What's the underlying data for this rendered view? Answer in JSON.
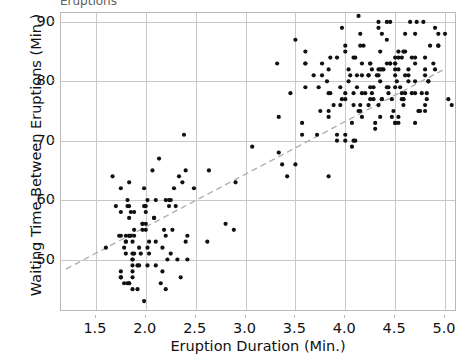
{
  "chart_data": {
    "type": "scatter",
    "title": "Eruptions",
    "xlabel": "Eruption Duration (Min.)",
    "ylabel": "Waiting Time Between Eruptions (Min.)",
    "xlim": [
      1.15,
      5.1
    ],
    "ylim": [
      41.5,
      91.5
    ],
    "xticks": [
      "1.5",
      "2.0",
      "2.5",
      "3.0",
      "3.5",
      "4.0",
      "4.5",
      "5.0"
    ],
    "xtick_values": [
      1.5,
      2.0,
      2.5,
      3.0,
      3.5,
      4.0,
      4.5,
      5.0
    ],
    "yticks": [
      "50",
      "60",
      "70",
      "80",
      "90"
    ],
    "ytick_values": [
      50,
      60,
      70,
      80,
      90
    ],
    "grid": true,
    "legend": "none",
    "marker": {
      "shape": "circle",
      "color": "#111111",
      "size": 4.2
    },
    "trendline": {
      "style": "dashed",
      "color": "#b0b0b0",
      "width": 1.4,
      "x": [
        1.2,
        5.0
      ],
      "y": [
        48.4,
        82.1
      ]
    },
    "series": [
      {
        "name": "Old Faithful eruptions",
        "points": [
          [
            3.6,
            79
          ],
          [
            1.8,
            54
          ],
          [
            3.333,
            74
          ],
          [
            2.283,
            62
          ],
          [
            4.533,
            85
          ],
          [
            2.883,
            55
          ],
          [
            4.7,
            88
          ],
          [
            3.6,
            85
          ],
          [
            1.95,
            51
          ],
          [
            4.35,
            85
          ],
          [
            1.833,
            54
          ],
          [
            3.917,
            84
          ],
          [
            4.2,
            78
          ],
          [
            1.75,
            47
          ],
          [
            4.7,
            83
          ],
          [
            2.167,
            52
          ],
          [
            1.75,
            62
          ],
          [
            4.8,
            84
          ],
          [
            1.6,
            52
          ],
          [
            4.25,
            79
          ],
          [
            1.8,
            51
          ],
          [
            1.75,
            47
          ],
          [
            3.45,
            78
          ],
          [
            3.067,
            69
          ],
          [
            4.533,
            74
          ],
          [
            3.6,
            83
          ],
          [
            1.967,
            55
          ],
          [
            4.083,
            76
          ],
          [
            3.85,
            78
          ],
          [
            4.433,
            79
          ],
          [
            4.3,
            73
          ],
          [
            4.467,
            77
          ],
          [
            3.367,
            66
          ],
          [
            4.033,
            80
          ],
          [
            3.833,
            74
          ],
          [
            2.017,
            52
          ],
          [
            1.867,
            48
          ],
          [
            4.833,
            80
          ],
          [
            1.833,
            59
          ],
          [
            4.783,
            90
          ],
          [
            4.35,
            80
          ],
          [
            1.883,
            58
          ],
          [
            4.567,
            84
          ],
          [
            1.75,
            58
          ],
          [
            4.533,
            73
          ],
          [
            3.317,
            83
          ],
          [
            3.833,
            64
          ],
          [
            2.1,
            53
          ],
          [
            4.633,
            82
          ],
          [
            2.0,
            59
          ],
          [
            4.8,
            75
          ],
          [
            4.716,
            90
          ],
          [
            1.833,
            54
          ],
          [
            4.833,
            80
          ],
          [
            1.733,
            54
          ],
          [
            4.883,
            83
          ],
          [
            3.717,
            71
          ],
          [
            1.667,
            64
          ],
          [
            4.567,
            77
          ],
          [
            4.317,
            81
          ],
          [
            2.233,
            59
          ],
          [
            4.5,
            84
          ],
          [
            1.75,
            48
          ],
          [
            4.8,
            82
          ],
          [
            1.817,
            60
          ],
          [
            4.4,
            92
          ],
          [
            4.167,
            78
          ],
          [
            4.7,
            78
          ],
          [
            2.067,
            65
          ],
          [
            4.7,
            73
          ],
          [
            4.033,
            82
          ],
          [
            1.967,
            56
          ],
          [
            4.5,
            79
          ],
          [
            4.0,
            71
          ],
          [
            1.983,
            62
          ],
          [
            5.067,
            76
          ],
          [
            2.017,
            60
          ],
          [
            4.567,
            78
          ],
          [
            3.883,
            76
          ],
          [
            3.6,
            83
          ],
          [
            4.133,
            75
          ],
          [
            4.333,
            82
          ],
          [
            4.1,
            70
          ],
          [
            2.633,
            65
          ],
          [
            4.067,
            73
          ],
          [
            4.933,
            88
          ],
          [
            3.95,
            76
          ],
          [
            4.517,
            80
          ],
          [
            2.167,
            48
          ],
          [
            4.0,
            86
          ],
          [
            2.2,
            60
          ],
          [
            4.333,
            90
          ],
          [
            1.867,
            50
          ],
          [
            4.817,
            78
          ],
          [
            1.833,
            63
          ],
          [
            4.3,
            72
          ],
          [
            4.667,
            84
          ],
          [
            3.75,
            75
          ],
          [
            1.867,
            51
          ],
          [
            4.9,
            82
          ],
          [
            2.483,
            62
          ],
          [
            4.367,
            88
          ],
          [
            2.1,
            49
          ],
          [
            4.5,
            83
          ],
          [
            4.05,
            81
          ],
          [
            1.867,
            47
          ],
          [
            4.7,
            84
          ],
          [
            1.783,
            52
          ],
          [
            4.85,
            86
          ],
          [
            3.683,
            81
          ],
          [
            4.733,
            75
          ],
          [
            2.3,
            59
          ],
          [
            4.9,
            89
          ],
          [
            4.417,
            79
          ],
          [
            1.7,
            59
          ],
          [
            4.633,
            81
          ],
          [
            2.317,
            50
          ],
          [
            4.6,
            85
          ],
          [
            1.817,
            59
          ],
          [
            4.417,
            87
          ],
          [
            2.617,
            53
          ],
          [
            4.067,
            69
          ],
          [
            4.25,
            77
          ],
          [
            1.967,
            56
          ],
          [
            4.6,
            88
          ],
          [
            3.767,
            81
          ],
          [
            1.917,
            45
          ],
          [
            4.5,
            82
          ],
          [
            2.267,
            55
          ],
          [
            4.65,
            90
          ],
          [
            1.867,
            45
          ],
          [
            4.167,
            83
          ],
          [
            2.8,
            56
          ],
          [
            4.333,
            89
          ],
          [
            1.833,
            46
          ],
          [
            4.383,
            82
          ],
          [
            1.883,
            51
          ],
          [
            4.933,
            86
          ],
          [
            2.033,
            53
          ],
          [
            3.733,
            79
          ],
          [
            4.233,
            81
          ],
          [
            2.233,
            60
          ],
          [
            4.533,
            82
          ],
          [
            4.817,
            77
          ],
          [
            4.333,
            76
          ],
          [
            1.983,
            59
          ],
          [
            4.633,
            80
          ],
          [
            2.017,
            49
          ],
          [
            5.1,
            96
          ],
          [
            1.8,
            53
          ],
          [
            5.033,
            77
          ],
          [
            4.0,
            77
          ],
          [
            2.4,
            65
          ],
          [
            4.6,
            81
          ],
          [
            3.567,
            71
          ],
          [
            4.0,
            70
          ],
          [
            4.5,
            81
          ],
          [
            4.083,
            93
          ],
          [
            1.8,
            53
          ],
          [
            3.967,
            89
          ],
          [
            2.2,
            45
          ],
          [
            4.15,
            86
          ],
          [
            2.0,
            58
          ],
          [
            3.833,
            78
          ],
          [
            3.5,
            66
          ],
          [
            4.583,
            76
          ],
          [
            2.367,
            63
          ],
          [
            5.0,
            88
          ],
          [
            1.933,
            52
          ],
          [
            4.617,
            93
          ],
          [
            1.917,
            49
          ],
          [
            2.083,
            57
          ],
          [
            4.583,
            77
          ],
          [
            3.333,
            68
          ],
          [
            4.167,
            81
          ],
          [
            4.333,
            81
          ],
          [
            4.5,
            73
          ],
          [
            2.417,
            50
          ],
          [
            4.0,
            85
          ],
          [
            4.167,
            74
          ],
          [
            1.883,
            55
          ],
          [
            4.583,
            77
          ],
          [
            4.25,
            83
          ],
          [
            3.767,
            83
          ],
          [
            2.033,
            51
          ],
          [
            4.433,
            78
          ],
          [
            4.083,
            84
          ],
          [
            1.833,
            46
          ],
          [
            4.417,
            83
          ],
          [
            2.183,
            55
          ],
          [
            4.8,
            81
          ],
          [
            1.833,
            57
          ],
          [
            4.8,
            76
          ],
          [
            4.1,
            84
          ],
          [
            3.966,
            77
          ],
          [
            4.233,
            81
          ],
          [
            3.5,
            87
          ],
          [
            4.366,
            77
          ],
          [
            2.25,
            51
          ],
          [
            4.667,
            78
          ],
          [
            2.1,
            60
          ],
          [
            4.35,
            82
          ],
          [
            4.133,
            91
          ],
          [
            1.867,
            53
          ],
          [
            4.6,
            78
          ],
          [
            1.783,
            46
          ],
          [
            4.367,
            77
          ],
          [
            3.85,
            84
          ],
          [
            1.933,
            49
          ],
          [
            4.5,
            83
          ],
          [
            2.383,
            71
          ],
          [
            4.7,
            80
          ],
          [
            1.867,
            49
          ],
          [
            3.833,
            75
          ],
          [
            3.417,
            64
          ],
          [
            4.233,
            76
          ],
          [
            2.4,
            53
          ],
          [
            4.8,
            94
          ],
          [
            2.0,
            55
          ],
          [
            4.15,
            76
          ],
          [
            1.867,
            50
          ],
          [
            4.267,
            82
          ],
          [
            1.75,
            54
          ],
          [
            4.483,
            75
          ],
          [
            4.0,
            78
          ],
          [
            4.117,
            79
          ],
          [
            4.083,
            78
          ],
          [
            4.267,
            78
          ],
          [
            3.917,
            70
          ],
          [
            4.55,
            79
          ],
          [
            4.083,
            70
          ],
          [
            2.417,
            54
          ],
          [
            4.183,
            86
          ],
          [
            2.217,
            50
          ],
          [
            4.45,
            90
          ],
          [
            1.883,
            54
          ],
          [
            1.85,
            54
          ],
          [
            4.283,
            77
          ],
          [
            3.95,
            79
          ],
          [
            2.333,
            64
          ],
          [
            4.15,
            75
          ],
          [
            2.35,
            47
          ],
          [
            4.933,
            86
          ],
          [
            2.9,
            63
          ],
          [
            4.583,
            85
          ],
          [
            3.833,
            82
          ],
          [
            2.083,
            57
          ],
          [
            4.367,
            82
          ],
          [
            2.133,
            67
          ],
          [
            4.35,
            74
          ],
          [
            2.2,
            54
          ],
          [
            4.45,
            83
          ],
          [
            3.567,
            73
          ],
          [
            4.5,
            73
          ],
          [
            4.15,
            88
          ],
          [
            3.817,
            80
          ],
          [
            3.917,
            71
          ],
          [
            4.45,
            83
          ],
          [
            2.0,
            56
          ],
          [
            4.283,
            79
          ],
          [
            4.767,
            78
          ],
          [
            4.533,
            84
          ],
          [
            1.85,
            58
          ],
          [
            4.25,
            83
          ],
          [
            1.983,
            43
          ],
          [
            2.25,
            60
          ],
          [
            4.75,
            75
          ],
          [
            4.117,
            81
          ],
          [
            2.15,
            46
          ],
          [
            4.417,
            90
          ],
          [
            1.817,
            46
          ],
          [
            4.467,
            74
          ]
        ]
      }
    ]
  }
}
